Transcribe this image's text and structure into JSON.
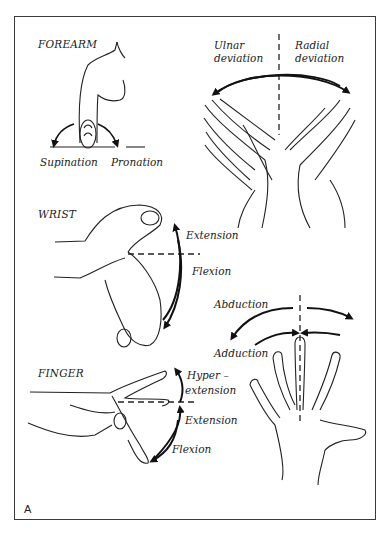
{
  "figure": {
    "panel_letter": "A",
    "sections": {
      "forearm": {
        "title": "FOREARM",
        "labels": {
          "left": "Supination",
          "right": "Pronation"
        }
      },
      "deviation": {
        "labels": {
          "ulnar_line1": "Ulnar",
          "ulnar_line2": "deviation",
          "radial_line1": "Radial",
          "radial_line2": "deviation"
        }
      },
      "wrist": {
        "title": "WRIST",
        "labels": {
          "up": "Extension",
          "down": "Flexion"
        }
      },
      "finger_spread": {
        "labels": {
          "outer": "Abduction",
          "inner": "Adduction"
        }
      },
      "finger": {
        "title": "FINGER",
        "labels": {
          "hyper_line1": "Hyper –",
          "hyper_line2": "extension",
          "extension": "Extension",
          "flexion": "Flexion"
        }
      }
    },
    "colors": {
      "ink": "#222222",
      "frame": "#3a3a3a",
      "background": "#ffffff"
    }
  }
}
